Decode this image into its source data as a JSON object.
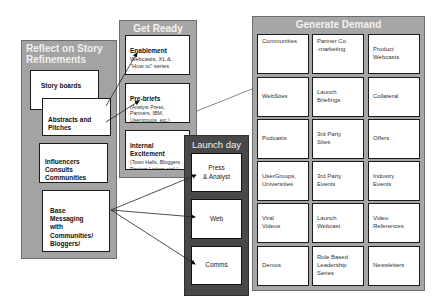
{
  "reflect": {
    "title": "Reflect on Story\nRefinements",
    "items": [
      {
        "label": "Story boards"
      },
      {
        "label": "Abstracts and\nPitches"
      },
      {
        "label": "Influencers\nConsults\nCommunities"
      },
      {
        "label": "Base\nMessaging\nwith\nCommunities/\nBloggers/"
      }
    ]
  },
  "get_ready": {
    "title": "Get Ready",
    "items": [
      {
        "label": "Enablement",
        "detail": "Webcasts, XL &\n\"How to\" series"
      },
      {
        "label": "Pre-briefs",
        "detail": "(Analyst Press,\nPartners,  IBM,\nUsergroups,  etc.)"
      },
      {
        "label": "Internal\nExcitement",
        "detail": "(Town Halls, Bloggers\nPosters,Letters,etc).)"
      }
    ]
  },
  "launch_day": {
    "title": "Launch day",
    "items": [
      {
        "label": "Press\n& Analyst"
      },
      {
        "label": "Web"
      },
      {
        "label": "Comms"
      }
    ]
  },
  "generate_demand": {
    "title": "Generate Demand",
    "cells": [
      "Communities",
      "Partner Co\n-marketing",
      "Product\nWebcasts",
      "WebSites",
      "Launch\nBriefings",
      "Collateral",
      "Podcasts",
      "3rd Party\nSites",
      "Offers",
      "UserGroups,\nUniversities",
      "3rd Party\nEvents",
      "Industry\nEvents",
      "Viral\nVideos",
      "Launch\nWebcast",
      "Video\nReferences",
      "Demos",
      "Role Based\nLeadership\nSeries",
      "Newsletters"
    ]
  },
  "colors": {
    "panel_gray": "#a6a6a6",
    "launch_dark": "#4a4a4a",
    "box_border": "#1a1a1a"
  }
}
